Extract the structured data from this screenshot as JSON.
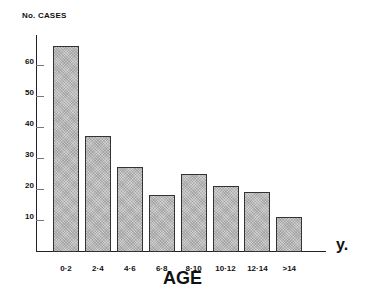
{
  "chart_data": {
    "type": "bar",
    "title": "",
    "ylabel": "No. CASES",
    "xlabel": "AGE",
    "x_unit": "y.",
    "categories": [
      "0·2",
      "2·4",
      "4·6",
      "6·8",
      "8·10",
      "10·12",
      "12·14",
      ">14"
    ],
    "values": [
      66,
      37,
      27,
      18,
      25,
      21,
      19,
      11
    ],
    "yticks": [
      10,
      20,
      30,
      40,
      50,
      60
    ],
    "ylim": [
      0,
      70
    ],
    "grid": false,
    "legend": null
  },
  "labels": {
    "ylabel": "No. CASES",
    "xlabel": "AGE",
    "unit": "y."
  }
}
